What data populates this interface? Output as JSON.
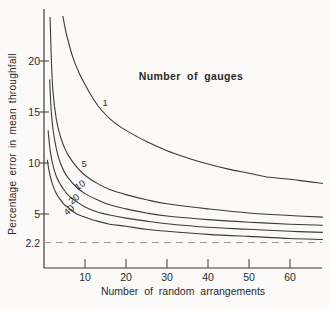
{
  "chart_data": {
    "type": "line",
    "legend_title": "Number of gauges",
    "xlabel": "Number of random arrangements",
    "ylabel": "Percentage error in mean throughfall",
    "xlim": [
      0,
      69
    ],
    "ylim": [
      0,
      25
    ],
    "x_ticks": [
      10,
      20,
      30,
      40,
      50,
      60
    ],
    "y_ticks": [
      5,
      10,
      15,
      20
    ],
    "grid": false,
    "asymptote": {
      "value": 2.2,
      "label": "2.2",
      "style": "dashed"
    },
    "series": [
      {
        "name": "1 gauge",
        "label": "1",
        "label_pos": [
          14.9,
          15.9
        ],
        "label_rotation": 0,
        "points": [
          [
            4.6,
            24.4
          ],
          [
            5.5,
            22.6
          ],
          [
            7,
            20.4
          ],
          [
            8.5,
            18.9
          ],
          [
            10,
            17.7
          ],
          [
            12,
            16.3
          ],
          [
            14,
            15.2
          ],
          [
            17,
            14.0
          ],
          [
            20,
            13.2
          ],
          [
            25,
            12.1
          ],
          [
            30,
            11.2
          ],
          [
            35,
            10.5
          ],
          [
            40,
            9.9
          ],
          [
            45,
            9.4
          ],
          [
            50,
            9.0
          ],
          [
            55,
            8.6
          ],
          [
            60,
            8.4
          ],
          [
            64,
            8.2
          ],
          [
            68,
            8.0
          ]
        ]
      },
      {
        "name": "5 gauges",
        "label": "5",
        "label_pos": [
          9.8,
          9.9
        ],
        "label_rotation": 0,
        "points": [
          [
            1.5,
            24.3
          ],
          [
            1.8,
            20.0
          ],
          [
            2.2,
            17.0
          ],
          [
            3,
            14.3
          ],
          [
            4,
            12.6
          ],
          [
            5,
            11.5
          ],
          [
            6,
            10.7
          ],
          [
            8,
            9.6
          ],
          [
            10,
            8.8
          ],
          [
            13,
            8.0
          ],
          [
            16,
            7.4
          ],
          [
            20,
            6.9
          ],
          [
            25,
            6.4
          ],
          [
            30,
            6.0
          ],
          [
            40,
            5.5
          ],
          [
            50,
            5.1
          ],
          [
            60,
            4.85
          ],
          [
            68,
            4.7
          ]
        ]
      },
      {
        "name": "10 gauges",
        "label": "10",
        "label_pos": [
          8.8,
          7.85
        ],
        "label_rotation": -35,
        "points": [
          [
            1.4,
            18.2
          ],
          [
            1.7,
            15.5
          ],
          [
            2.2,
            13.3
          ],
          [
            3,
            11.4
          ],
          [
            4,
            10.0
          ],
          [
            5,
            9.1
          ],
          [
            6,
            8.5
          ],
          [
            8,
            7.6
          ],
          [
            10,
            7.0
          ],
          [
            13,
            6.4
          ],
          [
            16,
            5.9
          ],
          [
            20,
            5.5
          ],
          [
            25,
            5.1
          ],
          [
            30,
            4.8
          ],
          [
            40,
            4.45
          ],
          [
            50,
            4.2
          ],
          [
            60,
            4.0
          ],
          [
            68,
            3.9
          ]
        ]
      },
      {
        "name": "20 gauges",
        "label": "20",
        "label_pos": [
          7.3,
          6.5
        ],
        "label_rotation": -38,
        "points": [
          [
            1.0,
            13.2
          ],
          [
            1.4,
            11.6
          ],
          [
            2,
            10.1
          ],
          [
            3,
            8.7
          ],
          [
            4,
            7.9
          ],
          [
            5,
            7.3
          ],
          [
            6,
            6.8
          ],
          [
            8,
            6.2
          ],
          [
            10,
            5.7
          ],
          [
            13,
            5.2
          ],
          [
            16,
            4.9
          ],
          [
            20,
            4.6
          ],
          [
            25,
            4.3
          ],
          [
            30,
            4.05
          ],
          [
            40,
            3.7
          ],
          [
            50,
            3.5
          ],
          [
            60,
            3.3
          ],
          [
            68,
            3.2
          ]
        ]
      },
      {
        "name": "40 gauges",
        "label": "40",
        "label_pos": [
          6.2,
          5.4
        ],
        "label_rotation": -40,
        "points": [
          [
            0.8,
            10.3
          ],
          [
            1.2,
            9.3
          ],
          [
            2,
            8.0
          ],
          [
            3,
            7.0
          ],
          [
            4,
            6.4
          ],
          [
            5,
            5.9
          ],
          [
            6,
            5.6
          ],
          [
            8,
            5.0
          ],
          [
            10,
            4.7
          ],
          [
            13,
            4.3
          ],
          [
            16,
            4.0
          ],
          [
            20,
            3.8
          ],
          [
            25,
            3.5
          ],
          [
            30,
            3.3
          ],
          [
            40,
            3.0
          ],
          [
            50,
            2.8
          ],
          [
            60,
            2.6
          ],
          [
            68,
            2.5
          ]
        ]
      }
    ],
    "colors": {
      "line": "#3b3b3b",
      "dashed": "#999999",
      "text": "#2a2a2a",
      "background": "#fbfaf8"
    }
  }
}
